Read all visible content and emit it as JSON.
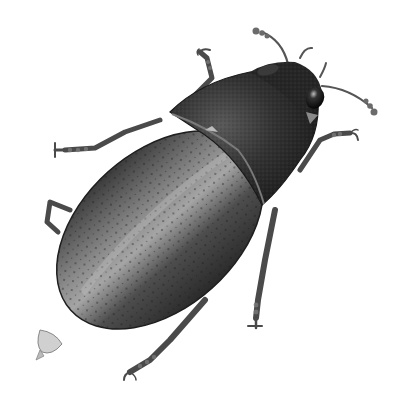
{
  "image": {
    "subject": "beetle illustration",
    "description": "Grayscale scientific illustration of a beetle viewed from above, oriented diagonally with head at upper right and abdomen tip at lower left",
    "style": "grayscale stipple/airbrush illustration",
    "background_color": "#ffffff",
    "colors": {
      "elytra_dark": "#2e2e2e",
      "elytra_mid": "#6a6a6a",
      "elytra_highlight": "#a8a8a8",
      "pronotum": "#2a2a2a",
      "legs": "#5a5a5a",
      "eye": "#111111"
    },
    "parts": [
      "head",
      "eyes",
      "antennae",
      "pronotum",
      "elytra",
      "legs",
      "abdomen-tip"
    ]
  }
}
